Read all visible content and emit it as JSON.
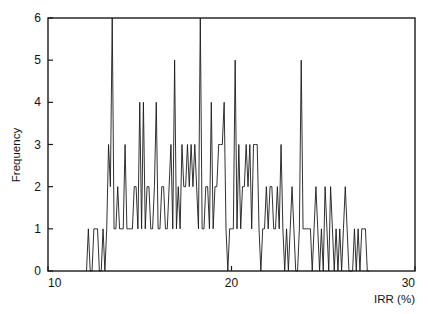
{
  "chart_data": {
    "type": "line",
    "title": "",
    "subtitle": "",
    "xlabel": "IRR (%)",
    "ylabel": "Frequency",
    "xlim": [
      10,
      30
    ],
    "ylim": [
      0,
      6
    ],
    "xticks": [
      10,
      20,
      30
    ],
    "xtick_labels": [
      "10",
      "20",
      "30"
    ],
    "yticks": [
      0,
      1,
      2,
      3,
      4,
      5,
      6
    ],
    "ytick_labels": [
      "0",
      "1",
      "2",
      "3",
      "4",
      "5",
      "6"
    ],
    "grid": false,
    "legend": null,
    "legend_position": "none",
    "annotations": [],
    "series": [
      {
        "name": "Frequency of IRR",
        "x": [
          12.1,
          12.2,
          12.3,
          12.4,
          12.5,
          12.6,
          12.7,
          12.8,
          12.9,
          13.0,
          13.1,
          13.2,
          13.3,
          13.4,
          13.5,
          13.6,
          13.7,
          13.8,
          13.9,
          14.0,
          14.1,
          14.2,
          14.3,
          14.4,
          14.5,
          14.6,
          14.7,
          14.8,
          14.9,
          15.0,
          15.1,
          15.2,
          15.3,
          15.4,
          15.5,
          15.6,
          15.7,
          15.8,
          15.9,
          16.0,
          16.1,
          16.2,
          16.3,
          16.4,
          16.5,
          16.6,
          16.7,
          16.8,
          16.9,
          17.0,
          17.1,
          17.2,
          17.3,
          17.4,
          17.5,
          17.6,
          17.7,
          17.8,
          17.9,
          18.0,
          18.1,
          18.2,
          18.3,
          18.4,
          18.5,
          18.6,
          18.7,
          18.8,
          18.9,
          19.0,
          19.1,
          19.2,
          19.3,
          19.4,
          19.5,
          19.6,
          19.7,
          19.8,
          19.9,
          20.0,
          20.1,
          20.2,
          20.3,
          20.4,
          20.5,
          20.6,
          20.7,
          20.8,
          20.9,
          21.0,
          21.1,
          21.2,
          21.3,
          21.4,
          21.5,
          21.6,
          21.7,
          21.8,
          21.9,
          22.0,
          22.1,
          22.2,
          22.3,
          22.4,
          22.5,
          22.6,
          22.7,
          22.8,
          22.9,
          23.0,
          23.1,
          23.2,
          23.3,
          23.4,
          23.5,
          23.6,
          23.7,
          23.8,
          23.9,
          24.0,
          24.1,
          24.2,
          24.3,
          24.4,
          24.5,
          24.6,
          24.7,
          24.8,
          24.9,
          25.0,
          25.1,
          25.2,
          25.3,
          25.4,
          25.5,
          25.6,
          25.7,
          25.8,
          25.9,
          26.0,
          26.1,
          26.2,
          26.3,
          26.4,
          26.5,
          26.6,
          26.7,
          26.8,
          26.9,
          27.0,
          27.1,
          27.2,
          27.3,
          27.4,
          27.5
        ],
        "values": [
          0,
          1,
          0,
          0,
          1,
          1,
          1,
          0,
          0,
          1,
          0,
          1,
          3,
          2,
          6,
          1,
          1,
          2,
          1,
          1,
          1,
          3,
          1,
          1,
          1,
          1,
          2,
          2,
          1,
          4,
          1,
          4,
          1,
          2,
          2,
          1,
          1,
          2,
          4,
          1,
          1,
          2,
          2,
          1,
          1,
          2,
          3,
          1,
          5,
          1,
          2,
          1,
          3,
          2,
          2,
          3,
          2,
          3,
          2,
          3,
          2,
          1,
          6,
          1,
          1,
          2,
          2,
          1,
          4,
          1,
          2,
          2,
          3,
          3,
          3,
          4,
          1,
          0,
          1,
          1,
          1,
          5,
          1,
          3,
          1,
          2,
          2,
          3,
          2,
          3,
          1,
          3,
          3,
          3,
          1,
          0,
          1,
          1,
          2,
          1,
          2,
          2,
          1,
          1,
          2,
          1,
          3,
          1,
          0,
          1,
          0,
          1,
          2,
          1,
          0,
          0,
          1,
          5,
          1,
          1,
          1,
          1,
          1,
          0,
          1,
          2,
          1,
          0,
          1,
          0,
          2,
          1,
          0,
          2,
          1,
          0,
          1,
          0,
          1,
          0,
          1,
          2,
          1,
          0,
          0,
          0,
          1,
          0,
          1,
          0,
          1,
          1,
          1,
          0,
          0
        ]
      }
    ]
  },
  "figure": {
    "axis_color": "#1a1a1a",
    "data_color": "#1a1a1a",
    "background": "#ffffff"
  }
}
